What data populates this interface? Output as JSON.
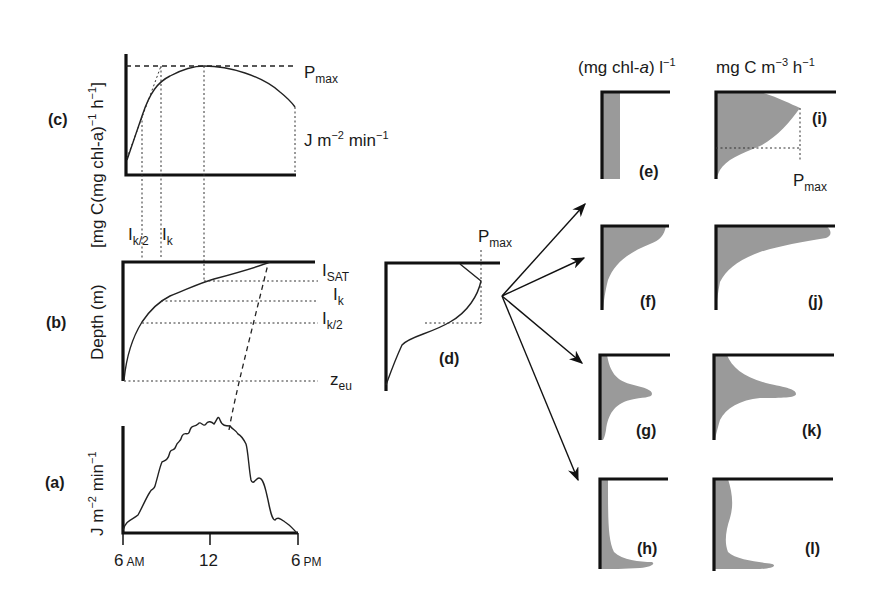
{
  "figure": {
    "panels": {
      "a": {
        "tag": "(a)",
        "ylabel": "J m",
        "ylabel_sup1": "−2",
        "ylabel_mid": " min",
        "ylabel_sup2": "−1",
        "xticks": [
          {
            "num": "6",
            "unit": "AM"
          },
          {
            "num": "12",
            "unit": ""
          },
          {
            "num": "6",
            "unit": "PM"
          }
        ]
      },
      "b": {
        "tag": "(b)",
        "ylabel": "Depth (m)",
        "levels": [
          {
            "base": "I",
            "sub": "SAT"
          },
          {
            "base": "I",
            "sub": "k"
          },
          {
            "base": "I",
            "sub": "k/2"
          },
          {
            "base": "z",
            "sub": "eu"
          }
        ],
        "top_marks": [
          {
            "base": "I",
            "sub": "k/2"
          },
          {
            "base": "I",
            "sub": "k"
          }
        ]
      },
      "c": {
        "tag": "(c)",
        "ylabel": "[mg C(mg chl-a)",
        "ylabel_sup1": "−1",
        "ylabel_mid": " h",
        "ylabel_sup2": "−1",
        "ylabel_end": "]",
        "pmax": {
          "base": "P",
          "sub": "max"
        },
        "xlabel": "J m",
        "xlabel_sup1": "−2",
        "xlabel_mid": " min",
        "xlabel_sup2": "−1"
      },
      "d": {
        "tag": "(d)",
        "pmax": {
          "base": "P",
          "sub": "max"
        }
      },
      "e": {
        "tag": "(e)"
      },
      "f": {
        "tag": "(f)"
      },
      "g": {
        "tag": "(g)"
      },
      "h": {
        "tag": "(h)"
      },
      "i": {
        "tag": "(i)",
        "pmax": {
          "base": "P",
          "sub": "max"
        }
      },
      "j": {
        "tag": "(j)"
      },
      "k": {
        "tag": "(k)"
      },
      "l": {
        "tag": "(l)"
      }
    },
    "column_headers": {
      "chl": {
        "text": "(mg chl-",
        "italic": "a",
        "close": ") l",
        "sup": "−1"
      },
      "prod": {
        "text": "mg C m",
        "sup1": "−3",
        "mid": " h",
        "sup2": "−1"
      }
    },
    "colors": {
      "line": "#222222",
      "axis": "#111111",
      "fill": "#9a9a9a",
      "background": "#ffffff"
    }
  }
}
